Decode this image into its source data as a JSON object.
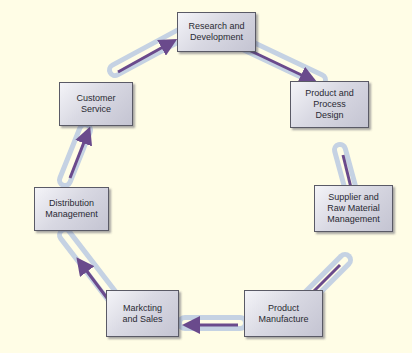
{
  "diagram": {
    "type": "cycle",
    "background_color": "#fffde6",
    "chain_color": "#b9c8dc",
    "arrow_color": "#6a4a8c",
    "box_border_color": "#5a5a66",
    "nodes": [
      {
        "id": "rd",
        "label": "Research and\nDevelopment"
      },
      {
        "id": "ppd",
        "label": "Product and\nProcess\nDesign"
      },
      {
        "id": "srm",
        "label": "Supplier and\nRaw Material\nManagement"
      },
      {
        "id": "pm",
        "label": "Product\nManufacture"
      },
      {
        "id": "ms",
        "label": "Markcting\nand Sales"
      },
      {
        "id": "dm",
        "label": "Distribution\nManagement"
      },
      {
        "id": "cs",
        "label": "Customer\nService"
      }
    ],
    "edges": [
      {
        "from": "rd",
        "to": "ppd"
      },
      {
        "from": "ppd",
        "to": "srm"
      },
      {
        "from": "srm",
        "to": "pm"
      },
      {
        "from": "pm",
        "to": "ms"
      },
      {
        "from": "ms",
        "to": "dm"
      },
      {
        "from": "dm",
        "to": "cs"
      },
      {
        "from": "cs",
        "to": "rd"
      }
    ]
  }
}
